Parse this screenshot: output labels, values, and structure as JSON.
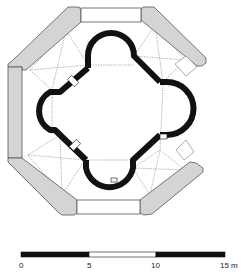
{
  "figure": {
    "type": "architectural floor plan",
    "colors": {
      "outer_wall_fill": "#d4d4d4",
      "outer_wall_stroke": "#555555",
      "inner_wall_fill": "#111111",
      "vault_lines": "#8a8a8a",
      "background": "#ffffff"
    }
  },
  "scale_bar": {
    "unit": "m",
    "ticks": [
      {
        "value": "0",
        "x": 21
      },
      {
        "value": "5",
        "x": 89
      },
      {
        "value": "10",
        "x": 156
      },
      {
        "value": "15 m",
        "x": 225
      }
    ],
    "segments": [
      {
        "from": 0,
        "to": 5,
        "fill": "#111111"
      },
      {
        "from": 5,
        "to": 10,
        "fill": "#ffffff"
      },
      {
        "from": 10,
        "to": 15,
        "fill": "#111111"
      }
    ]
  }
}
